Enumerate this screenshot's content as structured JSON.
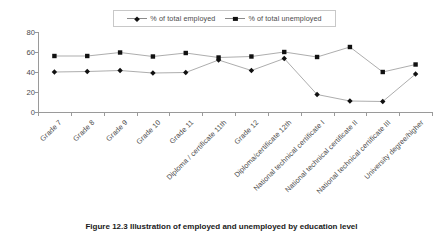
{
  "legend": {
    "entries": [
      {
        "label": "% of total employed",
        "marker": "diamond-marker-icon"
      },
      {
        "label": "% of total unemployed",
        "marker": "square-marker-icon"
      }
    ]
  },
  "caption": {
    "text": "Figure 12.3 Illustration of employed and unemployed by education level"
  },
  "chart_data": {
    "type": "line",
    "title": "",
    "subtitle": "",
    "xlabel": "",
    "ylabel": "",
    "ylim": [
      0,
      80
    ],
    "yticks": [
      0,
      20,
      40,
      60,
      80
    ],
    "grid": false,
    "legend_position": "top-center",
    "categories": [
      "Grade 7",
      "Grade 8",
      "Grade 9",
      "Grade 10",
      "Grade 11",
      "Diploma / certificate 11th",
      "Grade 12",
      "Diploma/certificate 12th",
      "National technical certificate I",
      "National technical certificate II",
      "National technical certificate III",
      "University degree/higher"
    ],
    "series": [
      {
        "name": "% of total employed",
        "marker": "diamond",
        "values": [
          40,
          40.5,
          41.5,
          39,
          39.5,
          52,
          41.5,
          53.5,
          17.5,
          11,
          10.5,
          38
        ]
      },
      {
        "name": "% of total unemployed",
        "marker": "square",
        "values": [
          56,
          56,
          59.5,
          55.5,
          59,
          54.5,
          55.5,
          60,
          55,
          65,
          40,
          47.5
        ]
      }
    ]
  }
}
